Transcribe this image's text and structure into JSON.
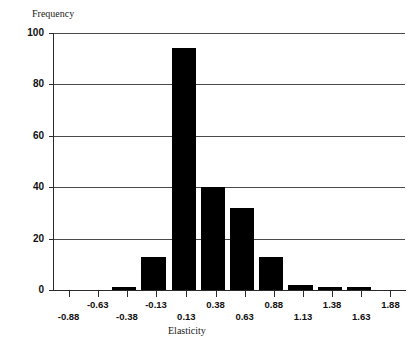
{
  "chart_data": {
    "type": "bar",
    "title": "",
    "xlabel": "Elasticity",
    "ylabel": "Frequency",
    "categories": [
      "-0.88",
      "-0.63",
      "-0.38",
      "-0.13",
      "0.13",
      "0.38",
      "0.63",
      "0.88",
      "1.13",
      "1.38",
      "1.63",
      "1.88"
    ],
    "values": [
      0,
      0,
      1,
      13,
      94,
      40,
      32,
      13,
      2,
      1,
      1,
      0
    ],
    "x_tick_labels": [
      "-0.88",
      "-0.63",
      "-0.38",
      "-0.13",
      "0.13",
      "0.38",
      "0.63",
      "0.88",
      "1.13",
      "1.38",
      "1.63",
      "1.88"
    ],
    "y_tick_labels": [
      "100",
      "80",
      "60",
      "40",
      "20",
      "0"
    ],
    "y_tick_values": [
      100,
      80,
      60,
      40,
      20,
      0
    ],
    "ylim": [
      0,
      100
    ],
    "xlim": [
      -1.005,
      2.005
    ],
    "grid": "horizontal",
    "legend": "none",
    "bar_color": "#000000",
    "grid_color": "#4a4a4a",
    "axis_color": "#2a2a2a",
    "bin_width": 0.25
  },
  "axes": {
    "y_title": "Frequency",
    "x_title": "Elasticity"
  },
  "y_ticks": [
    {
      "label": "100",
      "value": 100
    },
    {
      "label": "80",
      "value": 80
    },
    {
      "label": "60",
      "value": 60
    },
    {
      "label": "40",
      "value": 40
    },
    {
      "label": "20",
      "value": 20
    },
    {
      "label": "0",
      "value": 0
    }
  ],
  "x_ticks": [
    {
      "label": "-0.88",
      "value": -0.88,
      "row": "lower"
    },
    {
      "label": "-0.63",
      "value": -0.63,
      "row": "upper"
    },
    {
      "label": "-0.38",
      "value": -0.38,
      "row": "lower"
    },
    {
      "label": "-0.13",
      "value": -0.13,
      "row": "upper"
    },
    {
      "label": "0.13",
      "value": 0.13,
      "row": "lower"
    },
    {
      "label": "0.38",
      "value": 0.38,
      "row": "upper"
    },
    {
      "label": "0.63",
      "value": 0.63,
      "row": "lower"
    },
    {
      "label": "0.88",
      "value": 0.88,
      "row": "upper"
    },
    {
      "label": "1.13",
      "value": 1.13,
      "row": "lower"
    },
    {
      "label": "1.38",
      "value": 1.38,
      "row": "upper"
    },
    {
      "label": "1.63",
      "value": 1.63,
      "row": "lower"
    },
    {
      "label": "1.88",
      "value": 1.88,
      "row": "upper"
    }
  ],
  "bars": [
    {
      "center": -0.38,
      "value": 1
    },
    {
      "center": -0.13,
      "value": 13
    },
    {
      "center": 0.13,
      "value": 94
    },
    {
      "center": 0.38,
      "value": 40
    },
    {
      "center": 0.63,
      "value": 32
    },
    {
      "center": 0.88,
      "value": 13
    },
    {
      "center": 1.13,
      "value": 2
    },
    {
      "center": 1.38,
      "value": 1
    },
    {
      "center": 1.63,
      "value": 1
    }
  ]
}
